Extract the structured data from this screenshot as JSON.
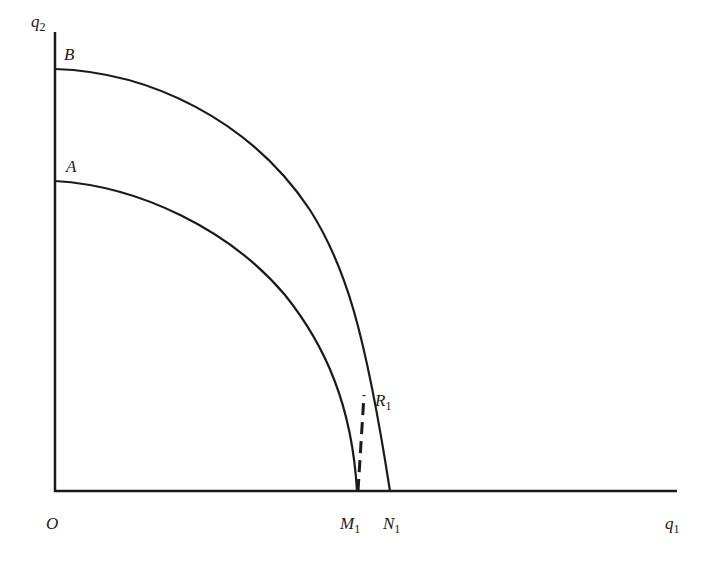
{
  "diagram": {
    "type": "production-possibility-frontiers",
    "axes": {
      "y_label": "q",
      "y_label_sub": "2",
      "x_label": "q",
      "x_label_sub": "1",
      "origin_label": "O"
    },
    "curves": [
      {
        "name": "A",
        "label": "A",
        "style": "solid",
        "y_intercept_px": 181,
        "x_intercept_label": "M",
        "x_intercept_sub": "1"
      },
      {
        "name": "B",
        "label": "B",
        "style": "solid",
        "y_intercept_px": 69,
        "x_intercept_label": "N",
        "x_intercept_sub": "1"
      }
    ],
    "points": [
      {
        "label": "R",
        "sub": "1",
        "description": "point on outer curve B above M1"
      }
    ],
    "dashed_line": {
      "from": "M1",
      "to": "R1",
      "style": "dashed"
    },
    "colors": {
      "line": "#1a1a1a",
      "background": "#ffffff"
    }
  }
}
